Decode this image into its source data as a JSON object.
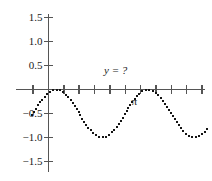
{
  "chart_data": {
    "type": "line",
    "title": "",
    "subtitle": "",
    "xlabel": "",
    "ylabel": "",
    "annotation": "y = ?",
    "style": "dotted",
    "marker": "square-dot",
    "grid": false,
    "legend": null,
    "axis_color": "#555555",
    "dot_color": "#141414",
    "xlim": [
      -0.55,
      7.2
    ],
    "ylim": [
      -1.5,
      1.5
    ],
    "y_ticks": [
      1.5,
      1.0,
      0.5,
      -0.5,
      -1.0,
      -1.5
    ],
    "y_tick_labels": [
      "1.5",
      "1.0",
      "0.5",
      "-0.5",
      "-1.0",
      "-1.5"
    ],
    "x_ticks": [
      -0.5235987756,
      0.0,
      0.5235987756,
      1.0471975512,
      1.5707963268,
      2.0943951024,
      2.617993878,
      3.1415926536,
      3.6651914292,
      4.1887902048,
      4.7123889804,
      5.235987756,
      5.7595865316,
      6.2831853072,
      6.8067840828
    ],
    "x_tick_labels": [
      "",
      "",
      "",
      "",
      "",
      "",
      "",
      "π",
      "",
      "",
      "",
      "",
      "",
      "2π",
      ""
    ],
    "labeled_x_ticks": [
      {
        "value": 3.1415926536,
        "label": "π"
      },
      {
        "value": 6.2831853072,
        "label": "2π"
      }
    ],
    "series": [
      {
        "name": "y",
        "description": "dotted cosine-type wave of period pi, amplitude 0.5, offset -0.5, peaks touching 0 and troughs at -1.0",
        "equation_form": "y = -0.5 + 0.5*cos(2*(x - 0.2618))",
        "period": 3.1415926536,
        "amplitude": 0.5,
        "offset": -0.5,
        "phase_shift": 0.2618,
        "ymax": 0.0,
        "ymin": -1.0,
        "peaks_x": [
          0.2618,
          3.4034,
          6.545
        ],
        "troughs_x": [
          -1.309,
          1.8326,
          4.9742
        ],
        "x": [
          -0.55,
          -0.45,
          -0.35,
          -0.25,
          -0.15,
          -0.05,
          0.05,
          0.15,
          0.25,
          0.35,
          0.45,
          0.55,
          0.65,
          0.75,
          0.85,
          0.95,
          1.05,
          1.15,
          1.25,
          1.35,
          1.45,
          1.55,
          1.65,
          1.75,
          1.85,
          1.95,
          2.05,
          2.15,
          2.25,
          2.35,
          2.45,
          2.55,
          2.65,
          2.75,
          2.85,
          2.95,
          3.05,
          3.15,
          3.25,
          3.35,
          3.45,
          3.55,
          3.65,
          3.75,
          3.85,
          3.95,
          4.05,
          4.15,
          4.25,
          4.35,
          4.45,
          4.55,
          4.65,
          4.75,
          4.85,
          4.95,
          5.05,
          5.15,
          5.25,
          5.35,
          5.45,
          5.55,
          5.65,
          5.75,
          5.85,
          5.95,
          6.05,
          6.15,
          6.25,
          6.35,
          6.45,
          6.55,
          6.65,
          6.75,
          6.85,
          6.95,
          7.05,
          7.15
        ],
        "y": [
          -0.47,
          -0.58,
          -0.69,
          -0.79,
          -0.88,
          -0.95,
          -0.24,
          -0.12,
          -0.04,
          -0.01,
          -0.02,
          -0.08,
          -0.18,
          -0.3,
          -0.43,
          -0.57,
          -0.7,
          -0.81,
          -0.9,
          -0.96,
          -1.0,
          -0.99,
          -0.95,
          -0.88,
          -0.78,
          -0.66,
          -0.53,
          -0.39,
          -0.27,
          -0.17,
          -0.08,
          -0.03,
          -0.01,
          -0.02,
          -0.07,
          -0.15,
          -0.25,
          -0.37,
          -0.5,
          -0.63,
          -0.76,
          -0.86,
          -0.94,
          -0.99,
          -1.0,
          -0.98,
          -0.93,
          -0.85,
          -0.74,
          -0.62,
          -0.48,
          -0.35,
          -0.23,
          -0.13,
          -0.06,
          -0.01,
          -0.01,
          -0.04,
          -0.1,
          -0.19,
          -0.31,
          -0.44,
          -0.57,
          -0.7,
          -0.81,
          -0.91,
          -0.97,
          -1.0,
          -0.99,
          -0.96,
          -0.89,
          -0.8,
          -0.68,
          -0.55,
          -0.42,
          -0.29,
          -0.18,
          -0.09
        ]
      }
    ]
  }
}
